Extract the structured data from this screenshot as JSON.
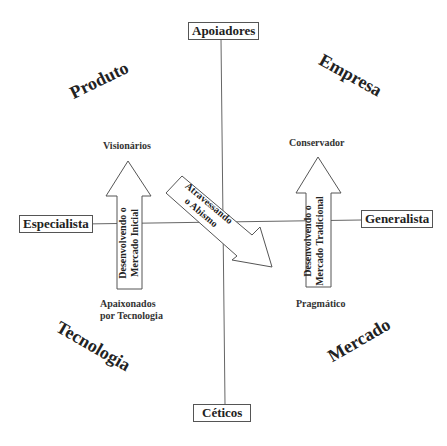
{
  "axes": {
    "top": "Apoiadores",
    "bottom": "Céticos",
    "left": "Especialista",
    "right": "Generalista"
  },
  "quadrants": {
    "top_left": "Produto",
    "top_right": "Empresa",
    "bottom_left": "Tecnologia",
    "bottom_right": "Mercado"
  },
  "labels": {
    "visionarios": "Visionários",
    "conservador": "Conservador",
    "apaixonados_line1": "Apaixonados",
    "apaixonados_line2": "por Tecnologia",
    "pragmatico": "Pragmático"
  },
  "arrows": {
    "left": {
      "line1": "Desenvolvendo o",
      "line2": "Mercado Inicial"
    },
    "right": {
      "line1": "Desenvolvendo o",
      "line2": "Mercado Tradicional"
    },
    "diagonal": {
      "line1": "Atravessando",
      "line2": "o Abismo"
    }
  }
}
